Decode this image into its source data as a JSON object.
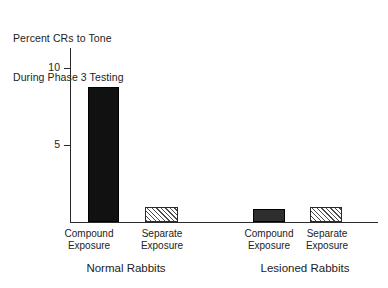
{
  "chart_data": {
    "type": "bar",
    "title": "Percent CRs to Tone During Phase 3 Testing",
    "title_lines": [
      "Percent CRs to Tone",
      "During Phase 3 Testing"
    ],
    "xlabel": "",
    "ylabel": "Percent CRs to Tone During Phase 3 Testing",
    "ylim": [
      0,
      11.3
    ],
    "yticks": [
      5,
      10
    ],
    "ytick_labels": [
      "5",
      "10"
    ],
    "grid": false,
    "legend": "none",
    "categories": [
      "Compound Exposure",
      "Separate Exposure",
      "Compound Exposure",
      "Separate Exposure"
    ],
    "values": [
      8.8,
      1.0,
      0.85,
      1.0
    ],
    "bar_styles": [
      "solid-black",
      "diagonal-hatch",
      "solid-dark",
      "diagonal-hatch"
    ],
    "groups": [
      {
        "name": "Normal Rabbits",
        "bars": [
          {
            "category_line1": "Compound",
            "category_line2": "Exposure",
            "value": 8.8,
            "style": "solid-black"
          },
          {
            "category_line1": "Separate",
            "category_line2": "Exposure",
            "value": 1.0,
            "style": "diagonal-hatch"
          }
        ]
      },
      {
        "name": "Lesioned Rabbits",
        "bars": [
          {
            "category_line1": "Compound",
            "category_line2": "Exposure",
            "value": 0.85,
            "style": "solid-dark"
          },
          {
            "category_line1": "Separate",
            "category_line2": "Exposure",
            "value": 1.0,
            "style": "diagonal-hatch"
          }
        ]
      }
    ],
    "colors": {
      "bar_solid": "#111111",
      "bar_dark": "#2e2e2e",
      "bar_hatch_line": "#4a4a4a",
      "bar_hatch_bg": "#ffffff",
      "axis": "#2b2b2b",
      "text": "#222222",
      "background": "#ffffff"
    }
  },
  "title": {
    "line1": "Percent CRs to Tone",
    "line2": "During Phase 3 Testing"
  },
  "axis": {
    "ytick_10": "10",
    "ytick_5": "5"
  },
  "bars": {
    "b1": {
      "line1": "Compound",
      "line2": "Exposure"
    },
    "b2": {
      "line1": "Separate",
      "line2": "Exposure"
    },
    "b3": {
      "line1": "Compound",
      "line2": "Exposure"
    },
    "b4": {
      "line1": "Separate",
      "line2": "Exposure"
    }
  },
  "groups": {
    "g1": "Normal Rabbits",
    "g2": "Lesioned Rabbits"
  }
}
